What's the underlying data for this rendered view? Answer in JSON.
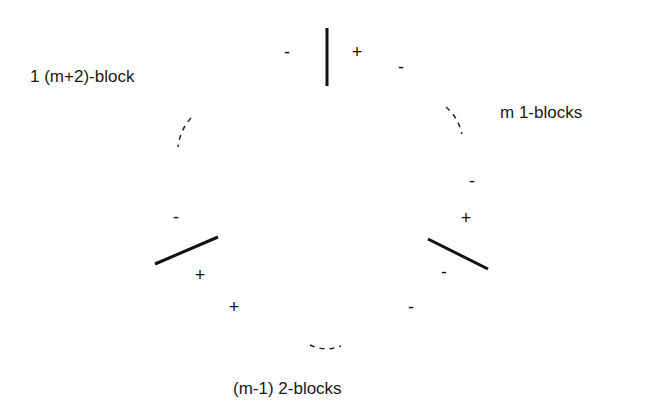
{
  "diagram": {
    "labels": {
      "top_left_block": "1 (m+2)-block",
      "right_blocks": "m 1-blocks",
      "bottom_blocks": "(m-1) 2-blocks"
    },
    "signs": [
      {
        "id": "top-left-minus",
        "text": "-",
        "x": 287,
        "y": 52
      },
      {
        "id": "top-right-plus",
        "text": "+",
        "x": 357,
        "y": 52
      },
      {
        "id": "top-far-right-minus",
        "text": "-",
        "x": 401,
        "y": 67
      },
      {
        "id": "right-upper-minus",
        "text": "-",
        "x": 472,
        "y": 181
      },
      {
        "id": "right-plus",
        "text": "+",
        "x": 466,
        "y": 218
      },
      {
        "id": "right-lower-minus",
        "text": "-",
        "x": 444,
        "y": 272
      },
      {
        "id": "bottom-right-minus",
        "text": "-",
        "x": 411,
        "y": 307
      },
      {
        "id": "left-minus",
        "text": "-",
        "x": 176,
        "y": 217
      },
      {
        "id": "left-plus",
        "text": "+",
        "x": 200,
        "y": 275
      },
      {
        "id": "bottom-left-plus",
        "text": "+",
        "x": 234,
        "y": 307
      }
    ],
    "segments": [
      {
        "id": "top-vertical-line",
        "x1": 327,
        "y1": 28,
        "x2": 327,
        "y2": 86
      },
      {
        "id": "left-slanted-line",
        "x1": 155,
        "y1": 264,
        "x2": 218,
        "y2": 237
      },
      {
        "id": "right-slanted-line",
        "x1": 428,
        "y1": 239,
        "x2": 488,
        "y2": 269
      }
    ],
    "colors": {
      "stroke": "#111111",
      "background": "#ffffff"
    }
  }
}
